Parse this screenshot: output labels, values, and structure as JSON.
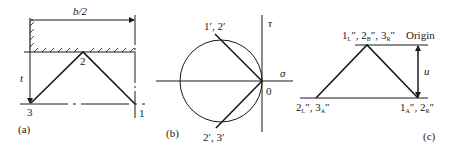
{
  "panel_a": {
    "caption": "(a)",
    "dimension_label": "b/2",
    "thickness_label": "t",
    "nodes": [
      {
        "id": "1",
        "label": "1",
        "x": 135,
        "y": 104
      },
      {
        "id": "2",
        "label": "2",
        "x": 83,
        "y": 52
      },
      {
        "id": "3",
        "label": "3",
        "x": 30,
        "y": 104
      }
    ]
  },
  "panel_b": {
    "caption": "(b)",
    "tau_axis_label": "τ",
    "sigma_axis_label": "σ",
    "origin_label": "0",
    "top_point_label": "1′, 2′",
    "bottom_point_label": "2′, 3′",
    "circle": {
      "cx": 221,
      "cy": 81,
      "r": 41
    }
  },
  "panel_c": {
    "caption": "(c)",
    "origin_label": "Origin",
    "displacement_label": "u",
    "apex_label": {
      "parts": [
        {
          "n": "1",
          "s": "L"
        },
        {
          "n": "2",
          "s": "B"
        },
        {
          "n": "3",
          "s": "R"
        }
      ]
    },
    "left_label": {
      "parts": [
        {
          "n": "2",
          "s": "L"
        },
        {
          "n": "3",
          "s": "A"
        }
      ]
    },
    "right_label": {
      "parts": [
        {
          "n": "1",
          "s": "A"
        },
        {
          "n": "2",
          "s": "R"
        }
      ]
    }
  }
}
